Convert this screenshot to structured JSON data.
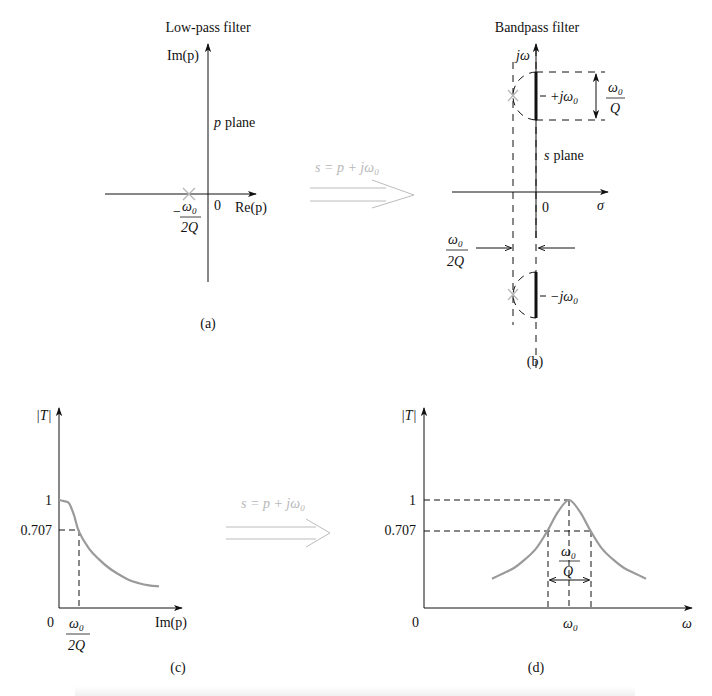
{
  "panel_a": {
    "title": "Low-pass filter",
    "y_axis_label": "Im(p)",
    "x_axis_label": "Re(p)",
    "plane_label_var": "p",
    "plane_label_word": "plane",
    "origin": "0",
    "pole_label_minus": "−",
    "pole_label_num": "ω",
    "pole_label_num_sub": "0",
    "pole_label_den": "2Q",
    "tag": "(a)"
  },
  "transform_top": {
    "label": "s = p + jω",
    "label_sub": "0"
  },
  "panel_b": {
    "title": "Bandpass filter",
    "y_axis_label": "jω",
    "x_axis_label": "σ",
    "plane_label_var": "s",
    "plane_label_word": "plane",
    "origin": "0",
    "upper_pole_label": "+jω",
    "upper_pole_sub": "0",
    "lower_pole_label": "−jω",
    "lower_pole_sub": "0",
    "bandwidth_num": "ω",
    "bandwidth_num_sub": "0",
    "bandwidth_den": "Q",
    "offset_num": "ω",
    "offset_num_sub": "0",
    "offset_den": "2Q",
    "tag": "(b)"
  },
  "transform_bottom": {
    "label": "s = p + jω",
    "label_sub": "0"
  },
  "panel_c": {
    "y_axis_label": "|T|",
    "x_axis_label": "Im(p)",
    "origin": "0",
    "tick_1": "1",
    "tick_0707": "0.707",
    "cutoff_num": "ω",
    "cutoff_num_sub": "0",
    "cutoff_den": "2Q",
    "tag": "(c)"
  },
  "panel_d": {
    "y_axis_label": "|T|",
    "x_axis_label": "ω",
    "origin": "0",
    "tick_1": "1",
    "tick_0707": "0.707",
    "center_label": "ω",
    "center_label_sub": "0",
    "bandwidth_num": "ω",
    "bandwidth_num_sub": "0",
    "bandwidth_den": "Q",
    "tag": "(d)"
  },
  "colors": {
    "axis": "#111111",
    "curve": "#9a9a9a",
    "pole": "#b5b5b5",
    "transform_arrow": "#b8b8b8"
  },
  "chart_data": [
    {
      "type": "line",
      "title": "Low-pass magnitude response (c)",
      "xlabel": "Im(p)",
      "ylabel": "|T|",
      "x": [
        0,
        0.25,
        0.5,
        0.75,
        1.0,
        1.5,
        2.0,
        2.5,
        3.0,
        3.5,
        4.0,
        4.5,
        5.0
      ],
      "x_units": "multiples of ω0/2Q",
      "y": [
        1.0,
        0.99,
        0.97,
        0.86,
        0.707,
        0.55,
        0.45,
        0.37,
        0.31,
        0.26,
        0.23,
        0.21,
        0.2
      ],
      "ytick_labels": [
        "1",
        "0.707"
      ],
      "xtick_labels": [
        "0",
        "ω0/2Q"
      ],
      "annotations": [
        "dashed guide at |T| = 0.707",
        "dashed guide at ω0/2Q"
      ]
    },
    {
      "type": "line",
      "title": "Bandpass magnitude response (d)",
      "xlabel": "ω",
      "ylabel": "|T|",
      "x": [
        -3.5,
        -3,
        -2.5,
        -2,
        -1.5,
        -1,
        -0.5,
        0,
        0.5,
        1,
        1.5,
        2,
        2.5,
        3,
        3.5
      ],
      "x_units": "offset from ω0 in multiples of ω0/2Q",
      "y": [
        0.27,
        0.32,
        0.37,
        0.45,
        0.55,
        0.707,
        0.89,
        1.0,
        0.89,
        0.707,
        0.55,
        0.45,
        0.37,
        0.32,
        0.27
      ],
      "ytick_labels": [
        "1",
        "0.707"
      ],
      "xtick_labels": [
        "0",
        "ω0"
      ],
      "annotations": [
        "bandwidth ω0/Q between −3 dB points",
        "dashed guides at |T| = 1 and 0.707"
      ]
    }
  ]
}
